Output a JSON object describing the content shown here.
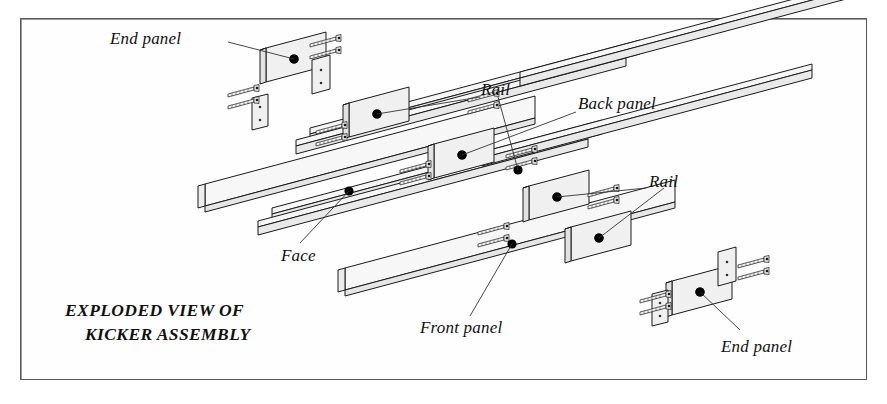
{
  "figure": {
    "type": "exploded-isometric-assembly-drawing",
    "title_line1": "EXPLODED VIEW OF",
    "title_line2": "KICKER ASSEMBLY",
    "border_color": "#5a5a5a",
    "line_color": "#1a1a1a",
    "fill_color": "#f4f4f4",
    "dot_color": "#000000"
  },
  "labels": [
    {
      "id": "end-panel-top",
      "text": "End panel",
      "x": 110,
      "y": 29
    },
    {
      "id": "rail-upper",
      "text": "Rail",
      "x": 481,
      "y": 80
    },
    {
      "id": "back-panel",
      "text": "Back panel",
      "x": 578,
      "y": 94
    },
    {
      "id": "rail-lower",
      "text": "Rail",
      "x": 649,
      "y": 172
    },
    {
      "id": "face",
      "text": "Face",
      "x": 281,
      "y": 246
    },
    {
      "id": "front-panel",
      "text": "Front panel",
      "x": 420,
      "y": 318
    },
    {
      "id": "end-panel-bottom",
      "text": "End panel",
      "x": 721,
      "y": 337
    }
  ],
  "title_block": {
    "x": 65,
    "y": 300,
    "line_gap": 24
  },
  "parts": {
    "rails": 4,
    "end_panels": 2,
    "divider_panels": 4,
    "face_boards": 2,
    "screws": 20
  }
}
